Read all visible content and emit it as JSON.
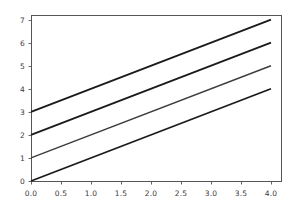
{
  "chart_data": {
    "type": "line",
    "title": "",
    "subtitle": "",
    "xlabel": "",
    "ylabel": "",
    "xlim": [
      0.0,
      4.0
    ],
    "ylim": [
      0.0,
      7.2
    ],
    "grid": false,
    "legend": null,
    "legend_position": "none",
    "background_color": "#ffffff",
    "axes_border_color": "#555555",
    "tick_label_color": "#3a3a3a",
    "x_ticks": [
      0.0,
      0.5,
      1.0,
      1.5,
      2.0,
      2.5,
      3.0,
      3.5,
      4.0
    ],
    "x_tick_labels": [
      "0.0",
      "0.5",
      "1.0",
      "1.5",
      "2.0",
      "2.5",
      "3.0",
      "3.5",
      "4.0"
    ],
    "y_ticks": [
      0,
      1,
      2,
      3,
      4,
      5,
      6,
      7
    ],
    "y_tick_labels": [
      "0",
      "1",
      "2",
      "3",
      "4",
      "5",
      "6",
      "7"
    ],
    "x": [
      0.0,
      4.0
    ],
    "series": [
      {
        "name": "line-1",
        "color": "#1a1a1a",
        "width": 1.8,
        "intercept": 3,
        "slope": 1,
        "values": [
          3.0,
          7.0
        ]
      },
      {
        "name": "line-2",
        "color": "#1a1a1a",
        "width": 1.8,
        "intercept": 2,
        "slope": 1,
        "values": [
          2.0,
          6.0
        ]
      },
      {
        "name": "line-3",
        "color": "#3d3d3d",
        "width": 1.4,
        "intercept": 1,
        "slope": 1,
        "values": [
          1.0,
          5.0
        ]
      },
      {
        "name": "line-4",
        "color": "#1a1a1a",
        "width": 1.8,
        "intercept": 0,
        "slope": 1,
        "values": [
          0.0,
          4.0
        ]
      }
    ]
  },
  "layout": {
    "plot_left": 31,
    "plot_right": 281,
    "plot_top": 15,
    "plot_bottom": 181,
    "data_x_right_px": 271,
    "tick_len": 3
  }
}
